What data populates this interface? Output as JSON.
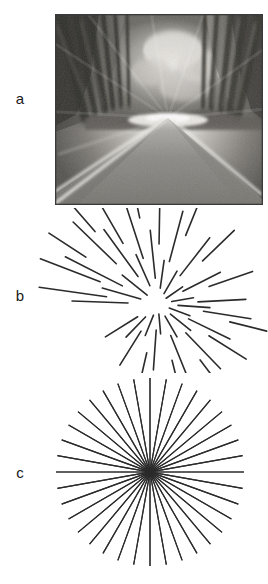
{
  "figure": {
    "background_color": "#ffffff",
    "ink_color": "#2b2b2b",
    "panels": [
      {
        "id": "a",
        "label": "a",
        "type": "photograph",
        "description": "grayscale motion-blurred photograph of a forest road receding to a vanishing point",
        "bounds": {
          "x": 55,
          "y": 14,
          "width": 208,
          "height": 191
        },
        "vanishing_point": {
          "x": 113,
          "y": 104
        },
        "border_color": "#3a3a3a"
      },
      {
        "id": "b",
        "label": "b",
        "type": "sparse-radial-lines",
        "description": "irregular radial line segments of varying length emanating from a common focus of expansion",
        "bounds": {
          "x": 20,
          "y": 208,
          "width": 248,
          "height": 165
        },
        "focus": {
          "x": 158,
          "y": 96
        },
        "stroke_width": 1.6,
        "line_count": 46
      },
      {
        "id": "c",
        "label": "c",
        "type": "dense-radial-starburst",
        "description": "dense uniform starburst of equally spaced full-length rays through a common center",
        "bounds": {
          "x": 20,
          "y": 373,
          "width": 248,
          "height": 211
        },
        "center": {
          "x": 150,
          "y": 99
        },
        "radius": 94,
        "ray_count": 36,
        "stroke_width": 1.15
      }
    ]
  },
  "panel_b_lines": [
    {
      "a1": 182,
      "r1": 30,
      "r2": 86
    },
    {
      "a1": 188,
      "r1": 52,
      "r2": 120
    },
    {
      "a1": 196,
      "r1": 18,
      "r2": 58
    },
    {
      "a1": 201,
      "r1": 62,
      "r2": 126
    },
    {
      "a1": 207,
      "r1": 40,
      "r2": 104
    },
    {
      "a1": 213,
      "r1": 86,
      "r2": 130
    },
    {
      "a1": 219,
      "r1": 14,
      "r2": 46
    },
    {
      "a1": 224,
      "r1": 58,
      "r2": 118
    },
    {
      "a1": 229,
      "r1": 96,
      "r2": 132
    },
    {
      "a1": 234,
      "r1": 34,
      "r2": 92
    },
    {
      "a1": 240,
      "r1": 70,
      "r2": 126
    },
    {
      "a1": 246,
      "r1": 20,
      "r2": 54
    },
    {
      "a1": 252,
      "r1": 48,
      "r2": 110
    },
    {
      "a1": 258,
      "r1": 88,
      "r2": 128
    },
    {
      "a1": 264,
      "r1": 26,
      "r2": 74
    },
    {
      "a1": 271,
      "r1": 60,
      "r2": 118
    },
    {
      "a1": 278,
      "r1": 16,
      "r2": 44
    },
    {
      "a1": 285,
      "r1": 44,
      "r2": 96
    },
    {
      "a1": 292,
      "r1": 74,
      "r2": 118
    },
    {
      "a1": 300,
      "r1": 12,
      "r2": 38
    },
    {
      "a1": 308,
      "r1": 36,
      "r2": 84
    },
    {
      "a1": 316,
      "r1": 62,
      "r2": 106
    },
    {
      "a1": 325,
      "r1": 10,
      "r2": 30
    },
    {
      "a1": 333,
      "r1": 28,
      "r2": 70
    },
    {
      "a1": 341,
      "r1": 54,
      "r2": 100
    },
    {
      "a1": 350,
      "r1": 14,
      "r2": 36
    },
    {
      "a1": 357,
      "r1": 40,
      "r2": 88
    },
    {
      "a1": 4,
      "r1": 20,
      "r2": 52
    },
    {
      "a1": 9,
      "r1": 46,
      "r2": 94
    },
    {
      "a1": 14,
      "r1": 74,
      "r2": 112
    },
    {
      "a1": 20,
      "r1": 12,
      "r2": 34
    },
    {
      "a1": 26,
      "r1": 34,
      "r2": 80
    },
    {
      "a1": 32,
      "r1": 60,
      "r2": 104
    },
    {
      "a1": 39,
      "r1": 16,
      "r2": 42
    },
    {
      "a1": 46,
      "r1": 40,
      "r2": 90
    },
    {
      "a1": 53,
      "r1": 70,
      "r2": 108
    },
    {
      "a1": 60,
      "r1": 14,
      "r2": 38
    },
    {
      "a1": 68,
      "r1": 34,
      "r2": 78
    },
    {
      "a1": 76,
      "r1": 58,
      "r2": 100
    },
    {
      "a1": 85,
      "r1": 10,
      "r2": 30
    },
    {
      "a1": 94,
      "r1": 26,
      "r2": 66
    },
    {
      "a1": 103,
      "r1": 50,
      "r2": 94
    },
    {
      "a1": 112,
      "r1": 12,
      "r2": 34
    },
    {
      "a1": 122,
      "r1": 32,
      "r2": 72
    },
    {
      "a1": 134,
      "r1": 18,
      "r2": 46
    },
    {
      "a1": 148,
      "r1": 24,
      "r2": 62
    }
  ]
}
